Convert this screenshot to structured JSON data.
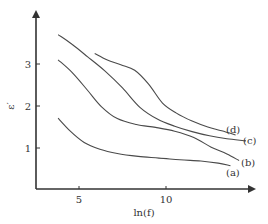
{
  "chart_data": {
    "type": "line",
    "title": "",
    "xlabel": "ln(f)",
    "ylabel": "ε′",
    "xlim": [
      2.5,
      15.5
    ],
    "ylim": [
      0,
      3.9
    ],
    "grid": false,
    "legend": "inline labels at curve ends",
    "xticks": [
      5,
      10
    ],
    "yticks": [
      1,
      2,
      3
    ],
    "series": [
      {
        "name": "(a)",
        "x": [
          3.8,
          4.5,
          5.3,
          6.2,
          7.2,
          8.4,
          9.6,
          10.8,
          12.0,
          13.0,
          13.7
        ],
        "y": [
          1.71,
          1.4,
          1.13,
          0.97,
          0.87,
          0.8,
          0.76,
          0.72,
          0.69,
          0.64,
          0.58
        ]
      },
      {
        "name": "(b)",
        "x": [
          3.8,
          4.6,
          5.5,
          6.3,
          7.2,
          8.3,
          9.4,
          10.5,
          11.6,
          12.6,
          13.5,
          14.2
        ],
        "y": [
          3.1,
          2.8,
          2.37,
          1.98,
          1.7,
          1.56,
          1.49,
          1.4,
          1.25,
          1.02,
          0.86,
          0.7
        ]
      },
      {
        "name": "(c)",
        "x": [
          3.8,
          4.6,
          5.5,
          6.5,
          7.5,
          8.5,
          9.5,
          10.5,
          11.5,
          12.5,
          13.5,
          14.6
        ],
        "y": [
          3.7,
          3.47,
          3.17,
          2.83,
          2.43,
          1.97,
          1.69,
          1.52,
          1.39,
          1.29,
          1.22,
          1.17
        ]
      },
      {
        "name": "(d)",
        "x": [
          5.9,
          6.6,
          7.4,
          8.2,
          9.0,
          9.8,
          10.6,
          11.5,
          12.4,
          13.2,
          14.0
        ],
        "y": [
          3.25,
          3.1,
          2.98,
          2.85,
          2.52,
          2.07,
          1.83,
          1.64,
          1.5,
          1.41,
          1.31
        ]
      }
    ]
  },
  "axes": {
    "xlabel": "ln(f)",
    "ylabel": "ε′",
    "xticks": [
      "5",
      "10"
    ],
    "yticks": [
      "1",
      "2",
      "3"
    ]
  },
  "labels": {
    "a": "(a)",
    "b": "(b)",
    "c": "(c)",
    "d": "(d)"
  }
}
